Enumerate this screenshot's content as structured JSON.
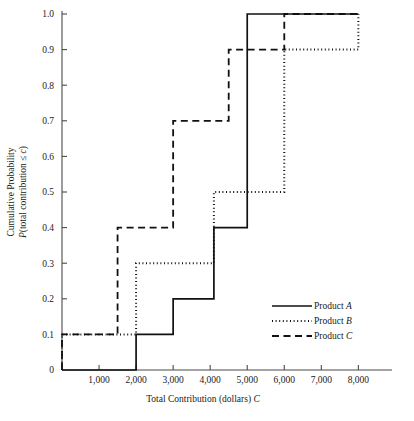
{
  "chart_data": {
    "type": "line",
    "title": "",
    "subtitle": "",
    "xlabel_parts": {
      "main": "Total Contribution (dollars) ",
      "italic": "C"
    },
    "xlabel": "Total Contribution (dollars) C",
    "ylabel_line1": "Cumulative Probability",
    "ylabel_line2_parts": {
      "italic_p": "P",
      "main": "(total contribution ≤ ",
      "italic_c": "c",
      "close": ")"
    },
    "ylabel": "Cumulative Probability P(total contribution ≤ c)",
    "xlim": [
      0,
      8800
    ],
    "ylim": [
      0,
      1.0
    ],
    "grid": false,
    "legend_position": "inside-right",
    "x_ticks": [
      {
        "value": 1000,
        "label": "1,000"
      },
      {
        "value": 2000,
        "label": "2,000"
      },
      {
        "value": 3000,
        "label": "3,000"
      },
      {
        "value": 4000,
        "label": "4,000"
      },
      {
        "value": 5000,
        "label": "5,000"
      },
      {
        "value": 6000,
        "label": "6,000"
      },
      {
        "value": 7000,
        "label": "7,000"
      },
      {
        "value": 8000,
        "label": "8,000"
      }
    ],
    "y_ticks": [
      {
        "value": 0.0,
        "label": "0"
      },
      {
        "value": 0.1,
        "label": "0.1"
      },
      {
        "value": 0.2,
        "label": "0.2"
      },
      {
        "value": 0.3,
        "label": "0.3"
      },
      {
        "value": 0.4,
        "label": "0.4"
      },
      {
        "value": 0.5,
        "label": "0.5"
      },
      {
        "value": 0.6,
        "label": "0.6"
      },
      {
        "value": 0.7,
        "label": "0.7"
      },
      {
        "value": 0.8,
        "label": "0.8"
      },
      {
        "value": 0.9,
        "label": "0.9"
      },
      {
        "value": 1.0,
        "label": "1.0"
      }
    ],
    "series": [
      {
        "name": "Product A",
        "name_main": "Product ",
        "name_italic": "A",
        "style": "solid",
        "color": "#111111",
        "steps": [
          {
            "x": 0,
            "y": 0.0
          },
          {
            "x": 2000,
            "y": 0.1
          },
          {
            "x": 3000,
            "y": 0.2
          },
          {
            "x": 4100,
            "y": 0.4
          },
          {
            "x": 5000,
            "y": 1.0
          },
          {
            "x": 8000,
            "y": 1.0
          }
        ]
      },
      {
        "name": "Product B",
        "name_main": "Product ",
        "name_italic": "B",
        "style": "dotted",
        "color": "#111111",
        "steps": [
          {
            "x": 0,
            "y": 0.1
          },
          {
            "x": 2000,
            "y": 0.3
          },
          {
            "x": 4100,
            "y": 0.5
          },
          {
            "x": 6000,
            "y": 0.9
          },
          {
            "x": 8000,
            "y": 1.0
          }
        ]
      },
      {
        "name": "Product C",
        "name_main": "Product ",
        "name_italic": "C",
        "style": "dashed",
        "color": "#111111",
        "steps": [
          {
            "x": 0,
            "y": 0.1
          },
          {
            "x": 1500,
            "y": 0.4
          },
          {
            "x": 3000,
            "y": 0.7
          },
          {
            "x": 4500,
            "y": 0.9
          },
          {
            "x": 6000,
            "y": 1.0
          },
          {
            "x": 8000,
            "y": 1.0
          }
        ]
      }
    ],
    "legend_entries": [
      {
        "label": "Product A",
        "label_main": "Product ",
        "label_italic": "A",
        "style": "solid"
      },
      {
        "label": "Product B",
        "label_main": "Product ",
        "label_italic": "B",
        "style": "dotted"
      },
      {
        "label": "Product C",
        "label_main": "Product ",
        "label_italic": "C",
        "style": "dashed"
      }
    ]
  }
}
